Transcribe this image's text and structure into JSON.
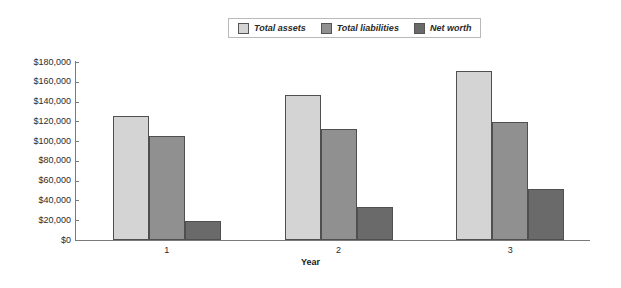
{
  "chart_data": {
    "type": "bar",
    "title": "",
    "xlabel": "Year",
    "ylabel": "",
    "categories": [
      "1",
      "2",
      "3"
    ],
    "series": [
      {
        "name": "Total assets",
        "values": [
          125000,
          147000,
          171000
        ],
        "color": "#d4d4d4"
      },
      {
        "name": "Total liabilities",
        "values": [
          105000,
          112000,
          119000
        ],
        "color": "#909090"
      },
      {
        "name": "Net worth",
        "values": [
          19000,
          33000,
          52000
        ],
        "color": "#6a6a6a"
      }
    ],
    "ylim": [
      0,
      180000
    ],
    "ytick_values": [
      0,
      20000,
      40000,
      60000,
      80000,
      100000,
      120000,
      140000,
      160000,
      180000
    ],
    "ytick_labels": [
      "$0",
      "$20,000",
      "$40,000",
      "$60,000",
      "$80,000",
      "$100,000",
      "$120,000",
      "$140,000",
      "$160,000",
      "$180,000"
    ],
    "grid": false,
    "legend_position": "top-center",
    "legend_entries": [
      "Total assets",
      "Total liabilities",
      "Net worth"
    ]
  },
  "style": {
    "axis_color": "#7a7a7a",
    "bar_outline": "#4f4f4f",
    "legend_border": "#b9b9b9",
    "background": "#ffffff"
  }
}
